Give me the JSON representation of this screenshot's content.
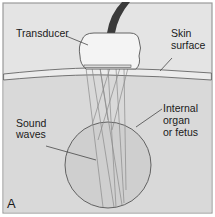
{
  "figure": {
    "panel_letter": "A",
    "labels": {
      "transducer": "Transducer",
      "skin_line1": "Skin",
      "skin_line2": "surface",
      "sound_line1": "Sound",
      "sound_line2": "waves",
      "organ_line1": "Internal",
      "organ_line2": "organ",
      "organ_line3": "or fetus"
    },
    "colors": {
      "background": "#e4e4e4",
      "tissue": "#d6d6d6",
      "skin_band": "#e9e9e9",
      "organ": "#cfcfcf",
      "transducer": "#f4f4f4",
      "cable": "#3a3a3a",
      "outline": "#555555",
      "wave": "#8a8a8a",
      "frame": "#9a9a9a"
    }
  }
}
